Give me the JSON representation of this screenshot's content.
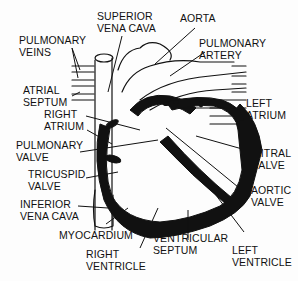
{
  "diagram": {
    "labels": {
      "superior_vena_cava": "SUPERIOR\nVENA CAVA",
      "aorta": "AORTA",
      "pulmonary_veins": "PULMONARY\nVEINS",
      "pulmonary_artery": "PULMONARY\nARTERY",
      "atrial_septum": "ATRIAL\nSEPTUM",
      "right_atrium": "RIGHT\nATRIUM",
      "left_atrium": "LEFT\nATRIUM",
      "pulmonary_valve": "PULMONARY\nVALVE",
      "mitral_valve": "MITRAL\nVALVE",
      "tricuspid_valve": "TRICUSPID\nVALVE",
      "aortic_valve": "AORTIC\nVALVE",
      "inferior_vena_cava": "INFERIOR\nVENA CAVA",
      "myocardium": "MYOCARDIUM",
      "right_ventricle": "RIGHT\nVENTRICLE",
      "ventricular_septum": "VENTRICULAR\nSEPTUM",
      "left_ventricle": "LEFT\nVENTRICLE"
    },
    "colors": {
      "ink": "#111111",
      "paper": "#fdfdfd"
    }
  }
}
